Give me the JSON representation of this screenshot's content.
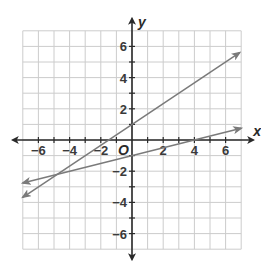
{
  "chart_data": {
    "type": "line",
    "title": "",
    "xlabel": "x",
    "ylabel": "y",
    "origin_label": "O",
    "xlim": [
      -7,
      7
    ],
    "ylim": [
      -7,
      7
    ],
    "grid": true,
    "x_ticks": [
      -6,
      -4,
      -2,
      2,
      4,
      6
    ],
    "y_ticks": [
      -6,
      -4,
      -2,
      2,
      4,
      6
    ],
    "x_tick_labels": [
      "−6",
      "−4",
      "−2",
      "2",
      "4",
      "6"
    ],
    "y_tick_labels": [
      "−6",
      "−4",
      "−2",
      "2",
      "4",
      "6"
    ],
    "series": [
      {
        "name": "line-1",
        "equation": "y = (2/3)x + 1",
        "x": [
          -7,
          6.9
        ],
        "y": [
          -3.67,
          5.6
        ],
        "arrows": "both"
      },
      {
        "name": "line-2",
        "equation": "y = (1/4)x - 1",
        "x": [
          -7,
          7
        ],
        "y": [
          -2.75,
          0.75
        ],
        "arrows": "both"
      }
    ],
    "intersection": {
      "x": -4.8,
      "y": -2.2
    },
    "colors": {
      "grid": "#cccccc",
      "axes": "#2a2a2a",
      "lines": "#7a7a7a"
    }
  }
}
